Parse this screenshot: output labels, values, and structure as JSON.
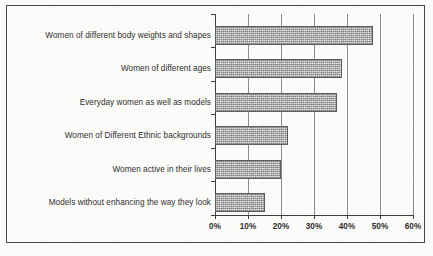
{
  "chart_data": {
    "type": "bar",
    "orientation": "horizontal",
    "title": "",
    "xlabel": "",
    "ylabel": "",
    "xlim": [
      0,
      60
    ],
    "xticks": [
      0,
      10,
      20,
      30,
      40,
      50,
      60
    ],
    "xtick_labels": [
      "0%",
      "10%",
      "20%",
      "30%",
      "40%",
      "50%",
      "60%"
    ],
    "grid": true,
    "legend": false,
    "value_suffix": "%",
    "categories": [
      "Women of different body weights and shapes",
      "Women of different ages",
      "Everyday women as well as models",
      "Women of Different Ethnic backgrounds",
      "Women active in their lives",
      "Models without enhancing the way they look"
    ],
    "values": [
      48,
      38.5,
      37,
      22,
      20,
      15
    ],
    "bar_fill_color": "#a8a8a8",
    "bar_border_color": "#5d5d5d",
    "axis_color": "#3f3f3f",
    "gridline_color": "#8d8d8d",
    "background_color": "#fbfbf9",
    "frame_border_color": "#4a4a4a"
  }
}
